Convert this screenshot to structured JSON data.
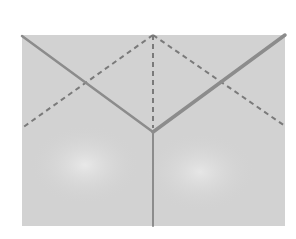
{
  "diagram": {
    "title": "",
    "colors": {
      "page_background": "#ffffff",
      "panel_fill": "#d2d2d2",
      "panel_highlight": "#e4e4e4",
      "solid_line": "#8c8c8c",
      "dashed_line": "#7a7a7a"
    },
    "panel": {
      "x": 22,
      "y": 35,
      "width": 263,
      "height": 191
    },
    "vertex": {
      "x": 153,
      "y": 132
    },
    "apex": {
      "x": 153,
      "y": 35
    },
    "solid_lines": [
      {
        "name": "left-edge",
        "x1": 22,
        "y1": 36,
        "x2": 153,
        "y2": 132,
        "width": 2.5
      },
      {
        "name": "right-edge",
        "x1": 153,
        "y1": 132,
        "x2": 285,
        "y2": 35,
        "width": 3.5
      },
      {
        "name": "vertical-edge",
        "x1": 153,
        "y1": 132,
        "x2": 153,
        "y2": 226,
        "width": 2
      }
    ],
    "dashed_lines": [
      {
        "name": "left-fold",
        "x1": 153,
        "y1": 35,
        "x2": 22,
        "y2": 128
      },
      {
        "name": "right-fold",
        "x1": 153,
        "y1": 35,
        "x2": 285,
        "y2": 126
      },
      {
        "name": "center-fold",
        "x1": 153,
        "y1": 35,
        "x2": 153,
        "y2": 128
      }
    ]
  }
}
